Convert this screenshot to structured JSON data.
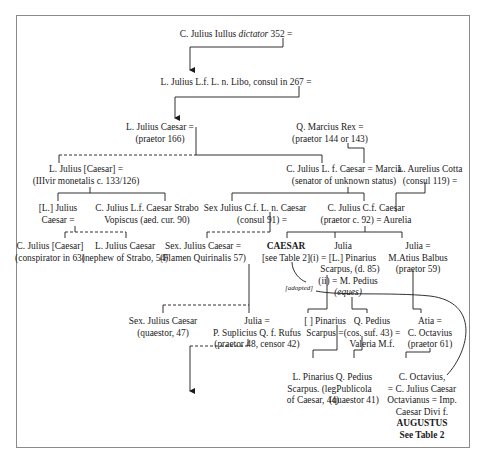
{
  "diagram": {
    "type": "family-tree",
    "line_color": "#1a1a1a",
    "frame_color": "#8a8a8a",
    "nodes": {
      "iullus": {
        "l1": "C. Julius Iullus",
        "l1b": "dictator",
        "l1c": "352 ="
      },
      "libo": {
        "l1": "L. Julius L.f. L. n. Libo, consul in 267 ="
      },
      "lcaesar166": {
        "l1": "L. Julius Caesar  =",
        "l2": "(praetor 166)"
      },
      "marcius": {
        "l1": "Q. Marcius Rex =",
        "l2": "(praetor 144 or 143)"
      },
      "lcaesar_monetalis": {
        "l1": "L. Julius [Caesar] =",
        "l2": "(IIIvir monetalis c. 133/126)"
      },
      "cjulius_senator": {
        "l1": "C. Julius L. f. Caesar = Marcia",
        "l2": "(senator of unknown status)"
      },
      "cotta": {
        "l1": "L. Aurelius Cotta",
        "l2": "(consul 119) ="
      },
      "l_julius_caesar": {
        "l1": "[L.] Julius",
        "l2": "Caesar ="
      },
      "strabo": {
        "l1": "C. Julius L.f. Caesar Strabo",
        "l2": "Vopiscus (aed. cur. 90)"
      },
      "sex_consul91": {
        "l1": "Sex Julius C.f. L. n. Caesar",
        "l2": "(consul 91) ="
      },
      "cjulius_praetor92": {
        "l1": "C. Julius C.f. Caesar",
        "l2": "(praetor c. 92) = Aurelia"
      },
      "conspirator": {
        "l1": "C. Julius [Caesar]",
        "l2": "(conspirator in 63)"
      },
      "nephew_strabo": {
        "l1": "L. Julius Caesar",
        "l2": "(nephew of Strabo, 54)"
      },
      "flamen": {
        "l1": "Sex. Julius Caesar =",
        "l2": "(Flamen Quirinalis 57)"
      },
      "caesar": {
        "l1": "CAESAR",
        "l2": "[see Table 2]"
      },
      "julia_pinarius": {
        "l1": "Julia",
        "l2": "(i) = [L.] Pinarius",
        "l3": "Scarpus, (d. 85)",
        "l4": "(ii) = M. Pedius",
        "l5": "(eques)"
      },
      "julia_balbus": {
        "l1": "Julia =",
        "l2": "M.Atius Balbus",
        "l3": "(praetor 59)"
      },
      "adopted_label": "[adopted]",
      "sex_quaestor47": {
        "l1": "Sex. Julius Caesar",
        "l2": "(quaestor, 47)"
      },
      "julia_rufus": {
        "l1": "Julia =",
        "l2": "P. Suplicius Q. f. Rufus",
        "l3": "(praetor 48, censor 42)"
      },
      "pinarius_scarpus": {
        "l1": "[ ] Pinarius",
        "l2": "Scarpus ="
      },
      "qpedius": {
        "l1": "Q. Pedius",
        "l2": "(cos. suf. 43) =",
        "l3": "Valeria M.f."
      },
      "atia": {
        "l1": "Atia =",
        "l2": "C. Octavius",
        "l3": "(praetor 61)"
      },
      "lpinarius": {
        "l1": "L. Pinarius",
        "l2": "Scarpus. (leg.",
        "l3": "of Caesar, 44)"
      },
      "qpedius_publicola": {
        "l1": "Q. Pedius",
        "l2": "Publicola",
        "l3": "(quaestor 41)"
      },
      "augustus": {
        "l1": "C. Octavius,",
        "l2": "= C. Julius Caesar",
        "l3": "Octavianus = Imp.",
        "l4": "Caesar Divi f.",
        "l5": "AUGUSTUS",
        "l6": "See Table 2"
      }
    }
  }
}
